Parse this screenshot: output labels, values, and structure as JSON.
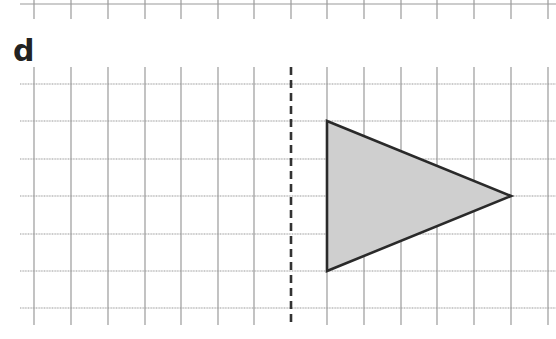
{
  "panel_label": "d",
  "top_strip": {
    "hline_y": 4,
    "tick_bottom": 19,
    "tick_xs": [
      34,
      71,
      108,
      145,
      181,
      218,
      254,
      291,
      327,
      364,
      401,
      437,
      474,
      511,
      548
    ]
  },
  "grid": {
    "x_start": 20,
    "x_end": 556,
    "y_start": 67,
    "y_end": 325,
    "vlines": [
      34,
      71,
      108,
      145,
      181,
      218,
      254,
      327,
      364,
      401,
      437,
      474,
      511,
      548
    ],
    "hlines": [
      84,
      121,
      159,
      196,
      234,
      271,
      308
    ],
    "line_color": "#9a9a9a"
  },
  "mirror_line": {
    "x": 291,
    "y1": 67,
    "y2": 325,
    "style": "dashed",
    "color": "#333333"
  },
  "triangle": {
    "points": [
      [
        327,
        121
      ],
      [
        511,
        196
      ],
      [
        327,
        271
      ]
    ],
    "fill": "#cfcfcf",
    "stroke": "#2a2a2a"
  }
}
